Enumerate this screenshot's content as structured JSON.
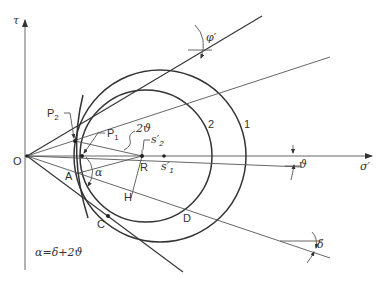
{
  "diagram": {
    "type": "Mohr circle construction (stress space)",
    "axes": {
      "x_label": "σ′",
      "y_label": "τ",
      "origin_label": "O"
    },
    "circles": [
      {
        "label": "1",
        "center_label": "s′1"
      },
      {
        "label": "2",
        "center_label": "s′2"
      }
    ],
    "points": {
      "P1": "P",
      "P1_sub": "1",
      "P2": "P",
      "P2_sub": "2",
      "A": "A",
      "C": "C",
      "D": "D",
      "H": "H",
      "R": "R",
      "s1": "s′",
      "s1_sub": "1",
      "s2": "s′",
      "s2_sub": "2"
    },
    "angles": {
      "phi": "φ′",
      "theta": "ϑ",
      "two_theta": "2ϑ",
      "alpha": "α",
      "delta": "δ"
    },
    "formula": "α=δ+2ϑ",
    "colors": {
      "line": "#333333",
      "background": "#ffffff"
    }
  }
}
